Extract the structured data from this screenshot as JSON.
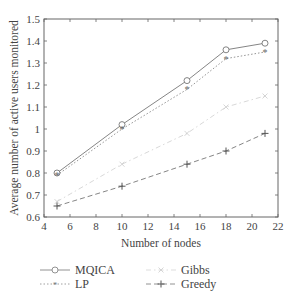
{
  "chart_data": {
    "type": "line",
    "title": "",
    "xlabel": "Number of nodes",
    "ylabel": "Average number of active users monitored",
    "xlim": [
      4,
      22
    ],
    "ylim": [
      0.6,
      1.5
    ],
    "xticks": [
      4,
      6,
      8,
      10,
      12,
      14,
      16,
      18,
      20,
      22
    ],
    "yticks": [
      0.6,
      0.7,
      0.8,
      0.9,
      1,
      1.1,
      1.2,
      1.3,
      1.4,
      1.5
    ],
    "xtick_labels": [
      "4",
      "6",
      "8",
      "10",
      "12",
      "14",
      "16",
      "18",
      "20",
      "22"
    ],
    "ytick_labels": [
      "0.6",
      "0.7",
      "0.8",
      "0.9",
      "1",
      "1.1",
      "1.2",
      "1.3",
      "1.4",
      "1.5"
    ],
    "grid": false,
    "legend_position": "bottom",
    "x": [
      5,
      10,
      15,
      18,
      21
    ],
    "series": [
      {
        "name": "MQICA",
        "values": [
          0.8,
          1.02,
          1.22,
          1.36,
          1.39
        ],
        "color": "#777777",
        "dash": "",
        "marker": "circle"
      },
      {
        "name": "LP",
        "values": [
          0.79,
          1.0,
          1.18,
          1.32,
          1.35
        ],
        "color": "#888888",
        "dash": "1.5,2",
        "marker": "star"
      },
      {
        "name": "Gibbs",
        "values": [
          0.67,
          0.84,
          0.98,
          1.1,
          1.15
        ],
        "color": "#d4d4d4",
        "dash": "5,3,1.5,3",
        "marker": "x"
      },
      {
        "name": "Greedy",
        "values": [
          0.65,
          0.74,
          0.84,
          0.9,
          0.98
        ],
        "color": "#777777",
        "dash": "5,3",
        "marker": "plus"
      }
    ]
  },
  "legend": {
    "items": [
      {
        "label": "MQICA"
      },
      {
        "label": "LP"
      },
      {
        "label": "Gibbs"
      },
      {
        "label": "Greedy"
      }
    ]
  }
}
